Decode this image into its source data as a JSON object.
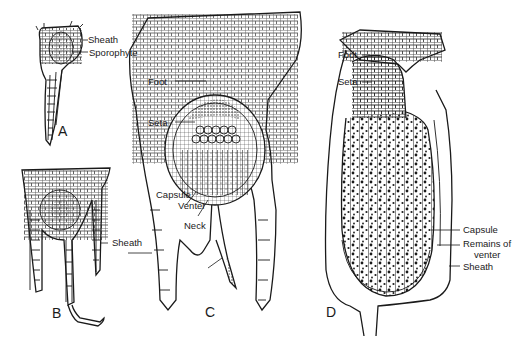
{
  "figure": {
    "panels": [
      {
        "id": "A",
        "letter": "A",
        "labels": [
          "Sheath",
          "Sporophyte"
        ]
      },
      {
        "id": "B",
        "letter": "B",
        "labels": [
          "Sheath"
        ]
      },
      {
        "id": "C",
        "letter": "C",
        "labels": [
          "Foot",
          "Seta",
          "Capsule",
          "Venter",
          "Neck",
          "Sheath"
        ]
      },
      {
        "id": "D",
        "letter": "D",
        "labels": [
          "Foot",
          "Seta",
          "Capsule",
          "Remains of venter",
          "Sheath"
        ]
      }
    ]
  },
  "labels": {
    "a_sheath": "Sheath",
    "a_sporophyte": "Sporophyte",
    "b_sheath": "Sheath",
    "c_foot": "Foot",
    "c_seta": "Seta",
    "c_capsule": "Capsule",
    "c_venter": "Venter",
    "c_neck": "Neck",
    "d_foot": "Foot",
    "d_seta": "Seta",
    "d_capsule": "Capsule",
    "d_remains_line1": "Remains of",
    "d_remains_line2": "venter",
    "d_sheath": "Sheath"
  },
  "letters": {
    "a": "A",
    "b": "B",
    "c": "C",
    "d": "D"
  },
  "colors": {
    "ink": "#1a1a1a",
    "background": "#ffffff"
  }
}
